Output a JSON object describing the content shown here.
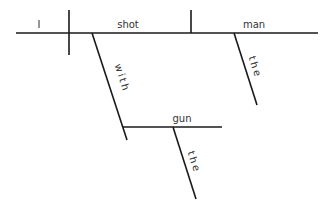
{
  "diagram": {
    "type": "sentence-diagram",
    "sentence_parts": {
      "subject": "I",
      "verb": "shot",
      "direct_object": "man",
      "object_modifier": "the",
      "preposition": "with",
      "prepositional_object": "gun",
      "prepositional_object_modifier": "the"
    },
    "colors": {
      "line": "#1a1a1a",
      "text": "#333333",
      "background": "#ffffff"
    }
  }
}
